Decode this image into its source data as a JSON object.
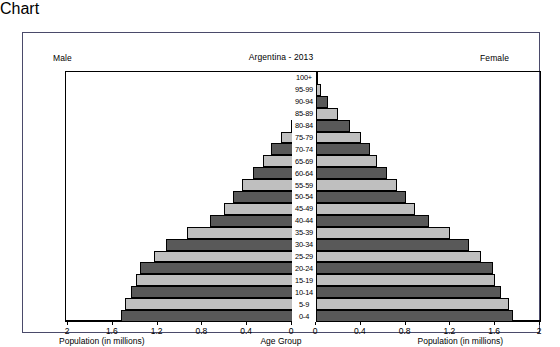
{
  "header": {
    "left_caption": "Male",
    "right_caption": "Female",
    "title": "Argentina - 2013"
  },
  "axis": {
    "left_label": "Population (in millions)",
    "right_label": "Population (in millions)",
    "center_label": "Age Group",
    "left_ticks": [
      "2",
      "1.6",
      "1.2",
      "0.8",
      "0.4",
      "0"
    ],
    "right_ticks": [
      "0",
      "0.4",
      "0.8",
      "1.2",
      "1.6",
      "2"
    ]
  },
  "colors": {
    "bar_dark": "#595959",
    "bar_light": "#bfbfbf",
    "bar_outline": "#000000",
    "frame": "#4a4a6a",
    "background": "#ffffff"
  },
  "chart_data": {
    "type": "bar",
    "title": "Argentina - 2013",
    "xlabel": "Population (in millions)",
    "ylabel": "Age Group",
    "xlim": [
      0,
      2
    ],
    "grid": false,
    "orientation": "horizontal",
    "layout": "population-pyramid",
    "categories": [
      "100+",
      "95-99",
      "90-94",
      "85-89",
      "80-84",
      "75-79",
      "70-74",
      "65-69",
      "60-64",
      "55-59",
      "50-54",
      "45-49",
      "40-44",
      "35-39",
      "30-34",
      "25-29",
      "20-24",
      "15-19",
      "10-14",
      "5-9",
      "0-4"
    ],
    "series": [
      {
        "name": "Male",
        "side": "left",
        "values": [
          0.004,
          0.021,
          0.058,
          0.118,
          0.205,
          0.295,
          0.38,
          0.455,
          0.545,
          0.64,
          0.72,
          0.8,
          0.93,
          1.13,
          1.32,
          1.43,
          1.55,
          1.585,
          1.63,
          1.69,
          1.725
        ]
      },
      {
        "name": "Female",
        "side": "right",
        "values": [
          0.01,
          0.045,
          0.11,
          0.195,
          0.3,
          0.4,
          0.48,
          0.545,
          0.635,
          0.72,
          0.8,
          0.88,
          1.01,
          1.2,
          1.37,
          1.47,
          1.58,
          1.6,
          1.655,
          1.72,
          1.76
        ]
      }
    ],
    "legend": [
      "Male",
      "Female"
    ],
    "legend_position": "top-corners"
  }
}
